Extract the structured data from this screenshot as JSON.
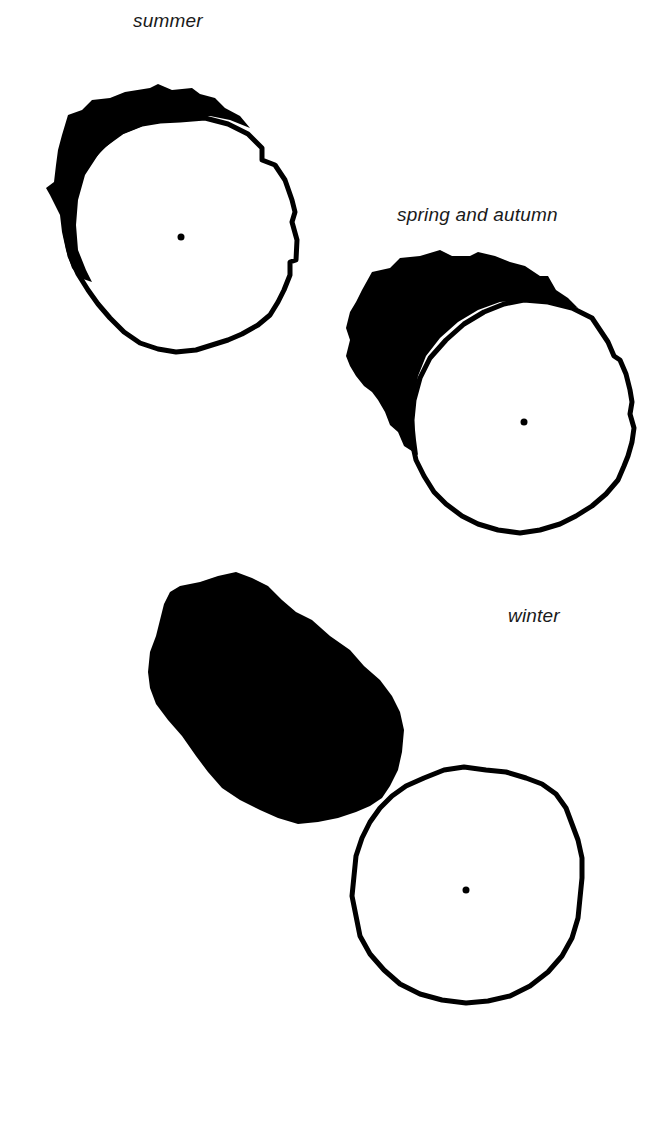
{
  "diagram": {
    "panels": [
      {
        "id": "summer",
        "label": "summer",
        "label_pos": [
          133,
          10
        ],
        "circle": {
          "cx": 180,
          "cy": 237,
          "rx": 116,
          "ry": 115
        },
        "center_dot": {
          "cx": 181,
          "cy": 237,
          "r": 3.5
        },
        "shadow_note": "thin crescent on upper-left of circle"
      },
      {
        "id": "spring-autumn",
        "label": "spring and autumn",
        "label_pos": [
          397,
          204
        ],
        "circle": {
          "cx": 523,
          "cy": 419,
          "rx": 113,
          "ry": 115
        },
        "center_dot": {
          "cx": 524,
          "cy": 422,
          "r": 3.5
        },
        "shadow_note": "wider crescent on upper-left of circle"
      },
      {
        "id": "winter",
        "label": "winter",
        "label_pos": [
          508,
          605
        ],
        "circle": {
          "cx": 468,
          "cy": 884,
          "rx": 114,
          "ry": 118
        },
        "center_dot": {
          "cx": 466,
          "cy": 890,
          "r": 3.5
        },
        "shadow_note": "detached oval blob upper-left of circle"
      }
    ],
    "colors": {
      "ink": "#000000",
      "background": "#ffffff",
      "label": "#1a1a1a"
    }
  }
}
